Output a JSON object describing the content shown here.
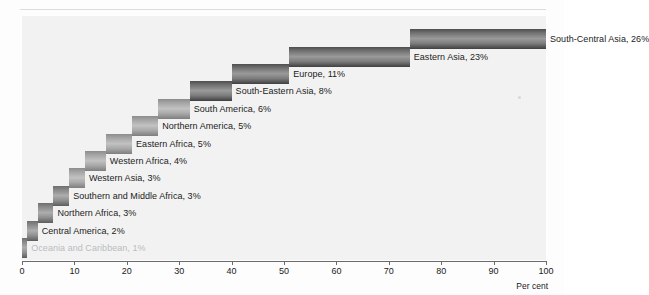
{
  "page": {
    "top_ghost_text": "",
    "axis_unit_label": "Per cent"
  },
  "chart_data": {
    "type": "bar",
    "title": "",
    "subtitle": "",
    "xlabel": "Per cent",
    "ylabel": "",
    "xlim": [
      0,
      100
    ],
    "grid": false,
    "legend": "none",
    "orientation": "horizontal",
    "stacking": "cumulative-waterfall",
    "xticks": [
      0,
      10,
      20,
      30,
      40,
      50,
      60,
      70,
      80,
      90,
      100
    ],
    "xtick_labels": [
      "0",
      "10",
      "20",
      "30",
      "40",
      "50",
      "60",
      "70",
      "80",
      "90",
      "100"
    ],
    "categories": [
      "Oceania and Caribbean",
      "Central America",
      "Northern Africa",
      "Southern and Middle Africa",
      "Western Asia",
      "Western Africa",
      "Eastern Africa",
      "Northern America",
      "South America",
      "South-Eastern Asia",
      "Europe",
      "Eastern Asia",
      "South-Central Asia"
    ],
    "values": [
      1,
      2,
      3,
      3,
      3,
      4,
      5,
      5,
      6,
      8,
      11,
      23,
      26
    ],
    "cumulative_start": [
      0,
      1,
      3,
      6,
      9,
      12,
      16,
      21,
      26,
      32,
      40,
      51,
      74
    ],
    "cumulative_end": [
      1,
      3,
      6,
      9,
      12,
      16,
      21,
      26,
      32,
      40,
      51,
      74,
      100
    ],
    "labels": [
      "Oceania and Caribbean, 1%",
      "Central America, 2%",
      "Northern Africa, 3%",
      "Southern and Middle Africa, 3%",
      "Western Asia, 3%",
      "Western Africa, 4%",
      "Eastern Africa, 5%",
      "Northern America, 5%",
      "South America, 6%",
      "South-Eastern Asia, 8%",
      "Europe, 11%",
      "Eastern Asia, 23%",
      "South-Central Asia, 26%"
    ],
    "colors": {
      "bar_dark": "#4e4e4e",
      "bar_mid": "#9a9a9a",
      "bar_light": "#c2c2c2",
      "plot_background": "#f2f2f2",
      "axis": "#6b6b6b",
      "text": "#1b1b1b"
    }
  }
}
